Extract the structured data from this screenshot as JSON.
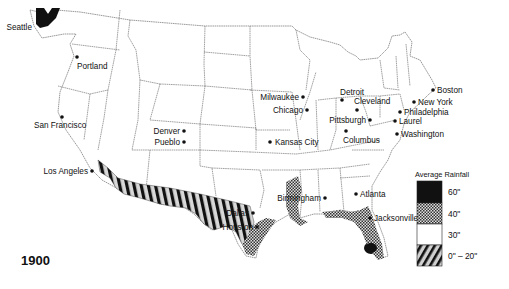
{
  "map": {
    "year": "1900",
    "legend": {
      "title": "Average Rainfall",
      "items": [
        {
          "label": "60\"",
          "pattern": "solid-black",
          "color": "#111111"
        },
        {
          "label": "40\"",
          "pattern": "crosshatch-dots",
          "color": "#8a8a8a"
        },
        {
          "label": "30\"",
          "pattern": "white",
          "color": "#ffffff"
        },
        {
          "label": "0\" – 20\"",
          "pattern": "diagonal-stripes",
          "color": "#111111"
        }
      ]
    },
    "cities": [
      {
        "name": "Seattle",
        "x": 34,
        "y": 30,
        "lx": -2,
        "ly": 0,
        "anchor": "end",
        "dot": false
      },
      {
        "name": "Portland",
        "x": 77,
        "y": 57,
        "lx": 0,
        "ly": 12,
        "anchor": "start",
        "dot": true
      },
      {
        "name": "San Francisco",
        "x": 62,
        "y": 117,
        "lx": -28,
        "ly": 11,
        "anchor": "start",
        "dot": true
      },
      {
        "name": "Los Angeles",
        "x": 92,
        "y": 171,
        "lx": -4,
        "ly": 3,
        "anchor": "end",
        "dot": true
      },
      {
        "name": "Denver",
        "x": 184,
        "y": 131,
        "lx": -4,
        "ly": 3,
        "anchor": "end",
        "dot": true
      },
      {
        "name": "Pueblo",
        "x": 184,
        "y": 142,
        "lx": -4,
        "ly": 3,
        "anchor": "end",
        "dot": true
      },
      {
        "name": "Kansas City",
        "x": 270,
        "y": 142,
        "lx": 5,
        "ly": 3,
        "anchor": "start",
        "dot": true
      },
      {
        "name": "Milwaukee",
        "x": 303,
        "y": 97,
        "lx": -4,
        "ly": 3,
        "anchor": "end",
        "dot": true
      },
      {
        "name": "Chicago",
        "x": 307,
        "y": 110,
        "lx": -4,
        "ly": 3,
        "anchor": "end",
        "dot": true
      },
      {
        "name": "Detroit",
        "x": 342,
        "y": 100,
        "lx": -2,
        "ly": -5,
        "anchor": "start",
        "dot": true
      },
      {
        "name": "Cleveland",
        "x": 357,
        "y": 110,
        "lx": -3,
        "ly": -6,
        "anchor": "start",
        "dot": true
      },
      {
        "name": "Pittsburgh",
        "x": 370,
        "y": 120,
        "lx": -4,
        "ly": 3,
        "anchor": "end",
        "dot": true
      },
      {
        "name": "Columbus",
        "x": 346,
        "y": 131,
        "lx": -3,
        "ly": 12,
        "anchor": "start",
        "dot": true
      },
      {
        "name": "Boston",
        "x": 433,
        "y": 90,
        "lx": 4,
        "ly": 3,
        "anchor": "start",
        "dot": true
      },
      {
        "name": "New York",
        "x": 414,
        "y": 102,
        "lx": 4,
        "ly": 3,
        "anchor": "start",
        "dot": true
      },
      {
        "name": "Philadelphia",
        "x": 400,
        "y": 112,
        "lx": 4,
        "ly": 3,
        "anchor": "start",
        "dot": true
      },
      {
        "name": "Laurel",
        "x": 395,
        "y": 121,
        "lx": 4,
        "ly": 3,
        "anchor": "start",
        "dot": true
      },
      {
        "name": "Washington",
        "x": 397,
        "y": 134,
        "lx": 4,
        "ly": 3,
        "anchor": "start",
        "dot": true
      },
      {
        "name": "Birmingham",
        "x": 325,
        "y": 198,
        "lx": -4,
        "ly": 3,
        "anchor": "end",
        "dot": true
      },
      {
        "name": "Atlanta",
        "x": 356,
        "y": 194,
        "lx": 4,
        "ly": 3,
        "anchor": "start",
        "dot": true
      },
      {
        "name": "Jacksonville",
        "x": 370,
        "y": 218,
        "lx": 4,
        "ly": 3,
        "anchor": "start",
        "dot": true
      },
      {
        "name": "Dallas",
        "x": 253,
        "y": 213,
        "lx": -4,
        "ly": 3,
        "anchor": "end",
        "dot": true
      },
      {
        "name": "Houston",
        "x": 257,
        "y": 227,
        "lx": -4,
        "ly": 3,
        "anchor": "end",
        "dot": true
      }
    ]
  }
}
